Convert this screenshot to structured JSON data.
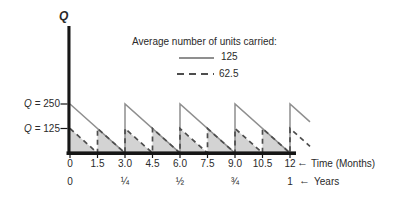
{
  "colors": {
    "axis": "#161616",
    "solid_line": "#8f8f8f",
    "dashed_line": "#4d4d4d",
    "fill": "#d3d3d3",
    "text": "#2a2a2a"
  },
  "chart_data": {
    "type": "line",
    "subtype": "inventory-sawtooth",
    "title": "",
    "y_axis_title": "Q",
    "ylim": [
      0,
      250
    ],
    "xlim_months": [
      0,
      12
    ],
    "grid": false,
    "y_reference_labels": [
      {
        "symbol": "Q",
        "rest": "= 250",
        "value": 250
      },
      {
        "symbol": "Q",
        "rest": "= 125",
        "value": 125
      }
    ],
    "x_axis_months": {
      "tick_values": [
        0,
        1.5,
        3,
        4.5,
        6,
        7.5,
        9,
        10.5,
        12
      ],
      "tick_labels": [
        "0",
        "1.5",
        "3.0",
        "4.5",
        "6.0",
        "7.5",
        "9.0",
        "10.5",
        "12"
      ],
      "arrow": "←",
      "title": "Time (Months)"
    },
    "x_axis_years": {
      "tick_values_months": [
        0,
        3,
        6,
        9,
        12
      ],
      "tick_labels": [
        "0",
        "¼",
        "½",
        "¾",
        "1"
      ],
      "arrow": "←",
      "title": "Years"
    },
    "legend": {
      "title": "Average number of units carried:",
      "entries": [
        {
          "style": "solid",
          "label": "125"
        },
        {
          "style": "dashed",
          "label": "62.5"
        }
      ]
    },
    "series": [
      {
        "name": "order-quantity-250",
        "style": "solid",
        "peak": 250,
        "period_months": 3,
        "average": 125,
        "filled": false
      },
      {
        "name": "order-quantity-125",
        "style": "dashed",
        "peak": 125,
        "period_months": 1.5,
        "average": 62.5,
        "filled": true
      }
    ]
  }
}
